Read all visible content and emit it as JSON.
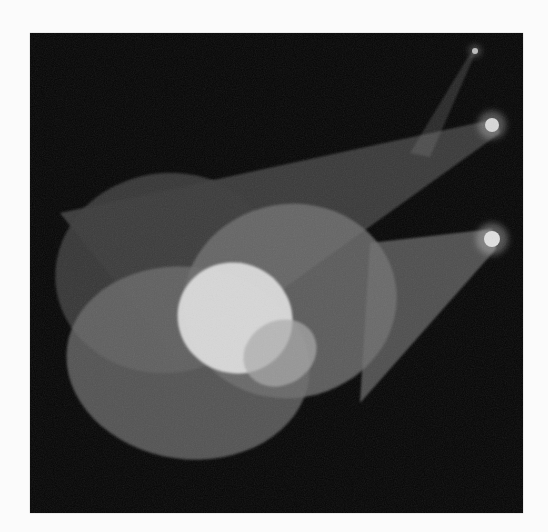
{
  "image": {
    "description": "Stage spotlights casting overlapping elliptical pools of light on a dark background",
    "background_color": "#fbfbfb",
    "photo_color": "#050505"
  },
  "scene": {
    "frame": {
      "x": 30,
      "y": 33,
      "width": 493,
      "height": 480
    },
    "lamps": [
      {
        "name": "top-lamp",
        "cx": 445,
        "cy": 18,
        "r": 3,
        "color": "#bdbdbd"
      },
      {
        "name": "upper-lamp",
        "cx": 462,
        "cy": 92,
        "r": 7,
        "color": "#d8d8d8"
      },
      {
        "name": "lower-lamp",
        "cx": 462,
        "cy": 206,
        "r": 8,
        "color": "#e0e0e0"
      }
    ],
    "beams": [
      {
        "name": "top-faint-beam",
        "points": "448,14 438,24 380,120 400,124",
        "color": "#6a6a6a",
        "opacity": 0.35
      },
      {
        "name": "upper-beam",
        "points": "466,86 470,100 150,330 30,180",
        "color": "#7a7a7a",
        "opacity": 0.45
      },
      {
        "name": "lower-beam",
        "points": "462,196 466,216 330,370 340,210",
        "color": "#8a8a8a",
        "opacity": 0.55
      }
    ],
    "pools": [
      {
        "name": "pool-left",
        "cx": 137,
        "cy": 240,
        "rx": 112,
        "ry": 100,
        "rotate": -8,
        "color": "#3a3a3a",
        "opacity": 0.9
      },
      {
        "name": "pool-right",
        "cx": 260,
        "cy": 268,
        "rx": 107,
        "ry": 97,
        "rotate": -10,
        "color": "#707070",
        "opacity": 0.8
      },
      {
        "name": "pool-bottom",
        "cx": 158,
        "cy": 330,
        "rx": 122,
        "ry": 96,
        "rotate": 8,
        "color": "#6c6c6c",
        "opacity": 0.75
      }
    ],
    "highlights": [
      {
        "name": "overlap-highlight",
        "cx": 205,
        "cy": 285,
        "rx": 58,
        "ry": 55,
        "rotate": 25,
        "color": "#dcdcdc",
        "opacity": 0.95
      },
      {
        "name": "overlap-secondary",
        "cx": 250,
        "cy": 320,
        "rx": 38,
        "ry": 32,
        "rotate": -30,
        "color": "#a9a9a9",
        "opacity": 0.7
      }
    ]
  }
}
